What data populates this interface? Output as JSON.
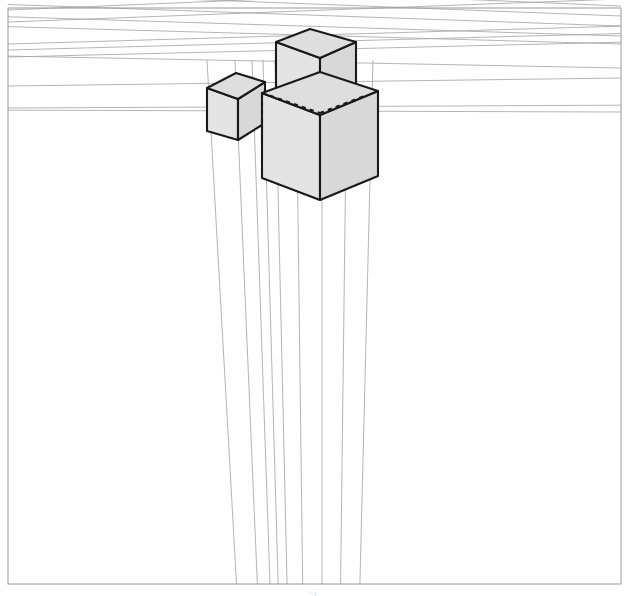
{
  "figure": {
    "caption": "fig.",
    "type": "line-drawing",
    "background_color": "#ffffff",
    "frame": {
      "visible": true,
      "color": "#9a9a9a",
      "stroke_width": 1,
      "x": 8,
      "y": 8,
      "width": 613,
      "height": 576
    }
  },
  "palette": {
    "construction_line": "#a8a8a8",
    "construction_line_faint": "#bdbdbd",
    "cube_edge": "#1a1a1a",
    "cube_edge_width": 2.1,
    "cube_fill": "#e4e4e4",
    "cube_fill_top": "#dedede",
    "cube_fill_right": "#d8d8d8",
    "hidden_edge": "#1a1a1a",
    "frame_line": "#9a9a9a"
  },
  "vanishing_points": [
    {
      "name": "vp-left",
      "label": "VP Left",
      "x": -2600,
      "y": 120,
      "visible": false
    },
    {
      "name": "vp-right",
      "label": "VP Right",
      "x": 3300,
      "y": 120,
      "visible": false
    },
    {
      "name": "vp-bottom",
      "label": "VP Bottom",
      "x": 322,
      "y": 2100,
      "visible": false
    }
  ],
  "construction_lines": {
    "left_bundle_count": 7,
    "right_bundle_count": 7,
    "vertical_bundle_count": 8,
    "description": "Converging guide lines toward three vanishing points"
  },
  "left_guide_y_at_edge": [
    10,
    22,
    44,
    50,
    57,
    86,
    108
  ],
  "right_guide_y_at_edge": [
    6,
    16,
    26,
    36,
    44,
    68,
    112
  ],
  "vertical_guide_x_at_top": [
    207,
    235,
    252,
    263,
    275,
    296,
    322,
    347,
    373
  ],
  "objects": [
    {
      "name": "cube-small-left",
      "label": "Small Left Cube",
      "position": "left",
      "size": "small",
      "top_face": [
        [
          207,
          88
        ],
        [
          236,
          73
        ],
        [
          265,
          82
        ],
        [
          238,
          99
        ]
      ],
      "left_face": [
        [
          207,
          88
        ],
        [
          238,
          99
        ],
        [
          238,
          140
        ],
        [
          207,
          131
        ]
      ],
      "right_face": [
        [
          238,
          99
        ],
        [
          265,
          82
        ],
        [
          265,
          123
        ],
        [
          238,
          140
        ]
      ],
      "hidden_edges": []
    },
    {
      "name": "cube-upper-back",
      "label": "Upper Back Cube",
      "position": "top",
      "size": "medium",
      "top_face": [
        [
          276,
          42
        ],
        [
          310,
          29
        ],
        [
          356,
          42
        ],
        [
          320,
          58
        ]
      ],
      "left_face": [
        [
          276,
          42
        ],
        [
          320,
          58
        ],
        [
          320,
          101
        ],
        [
          276,
          88
        ]
      ],
      "right_face": [
        [
          320,
          58
        ],
        [
          356,
          42
        ],
        [
          356,
          86
        ],
        [
          320,
          101
        ]
      ],
      "hidden_edges": [
        [
          [
            262,
            93
          ],
          [
            320,
            113
          ]
        ],
        [
          [
            320,
            113
          ],
          [
            367,
            95
          ]
        ],
        [
          [
            262,
            93
          ],
          [
            262,
            138
          ]
        ]
      ]
    },
    {
      "name": "cube-large-front",
      "label": "Large Front Cube",
      "position": "center-front",
      "size": "large",
      "top_face": [
        [
          262,
          93
        ],
        [
          320,
          72
        ],
        [
          378,
          91
        ],
        [
          320,
          115
        ]
      ],
      "left_face": [
        [
          262,
          93
        ],
        [
          320,
          115
        ],
        [
          320,
          200
        ],
        [
          262,
          178
        ]
      ],
      "right_face": [
        [
          320,
          115
        ],
        [
          378,
          91
        ],
        [
          378,
          176
        ],
        [
          320,
          200
        ]
      ],
      "hidden_edges": []
    }
  ],
  "draw_order": [
    "construction-lines",
    "cube-small-left",
    "cube-upper-back",
    "cube-large-front",
    "hidden-edges",
    "frame"
  ]
}
